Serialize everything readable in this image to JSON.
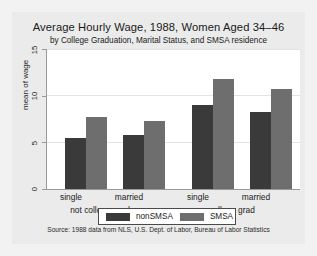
{
  "chart_data": {
    "type": "bar",
    "title": "Average Hourly Wage, 1988, Women Aged 34–46",
    "subtitle": "by College Graduation, Marital Status, and SMSA residence",
    "xlabel": "",
    "ylabel": "mean of wage",
    "ylim": [
      0,
      15
    ],
    "yticks": [
      0,
      5,
      10,
      15
    ],
    "ytick_labels": [
      "0",
      "5",
      "10",
      "15"
    ],
    "grid": "horizontal",
    "legend_position": "bottom-center",
    "groups": [
      {
        "group_label": "not college grad",
        "categories": [
          "single",
          "married"
        ]
      },
      {
        "group_label": "college grad",
        "categories": [
          "single",
          "married"
        ]
      }
    ],
    "categories": [
      "single",
      "married",
      "single",
      "married"
    ],
    "series": [
      {
        "name": "nonSMSA",
        "color": "#3a3a3a",
        "values": [
          5.5,
          5.8,
          9.0,
          8.2
        ]
      },
      {
        "name": "SMSA",
        "color": "#6e6e6e",
        "values": [
          7.7,
          7.3,
          11.8,
          10.7
        ]
      }
    ],
    "note": "Source:  1988 data from NLS, U.S. Dept. of Labor, Bureau of Labor Statistics"
  },
  "figure": {
    "background": "#ebebeb",
    "plot_background": "#ffffff",
    "axis_color": "#9a9a9a",
    "grid_color": "#e3e3e3"
  }
}
